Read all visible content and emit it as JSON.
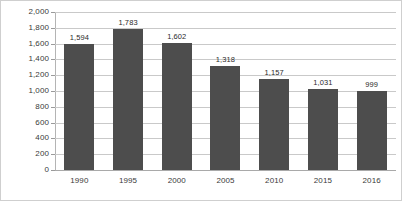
{
  "chart_data": {
    "type": "bar",
    "title": "",
    "xlabel": "",
    "ylabel": "",
    "categories": [
      "1990",
      "1995",
      "2000",
      "2005",
      "2010",
      "2015",
      "2016"
    ],
    "values": [
      1594,
      1783,
      1602,
      1318,
      1157,
      1031,
      999
    ],
    "value_labels": [
      "1,594",
      "1,783",
      "1,602",
      "1,318",
      "1,157",
      "1,031",
      "999"
    ],
    "ylim": [
      0,
      2000
    ],
    "ytick_values": [
      0,
      200,
      400,
      600,
      800,
      1000,
      1200,
      1400,
      1600,
      1800,
      2000
    ],
    "ytick_labels": [
      "0",
      "200",
      "400",
      "600",
      "800",
      "1,000",
      "1,200",
      "1,400",
      "1,600",
      "1,800",
      "2,000"
    ],
    "grid": true,
    "legend": false,
    "bar_color": "#4d4d4d",
    "grid_color": "#c9c9c9",
    "axis_color": "#b4b4b4",
    "background": "#ffffff"
  }
}
